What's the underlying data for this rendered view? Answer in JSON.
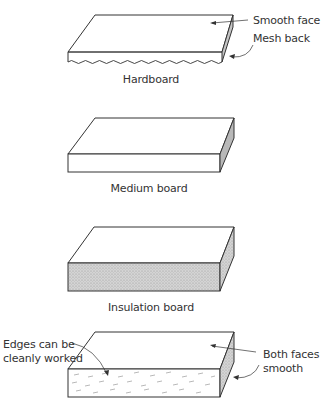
{
  "figure": {
    "boards": [
      {
        "name": "Hardboard",
        "callouts": [
          "Smooth face",
          "Mesh back"
        ]
      },
      {
        "name": "Medium board",
        "callouts": []
      },
      {
        "name": "Insulation board",
        "callouts": []
      },
      {
        "name": "",
        "callouts": [
          "Edges can be cleanly worked",
          "Both faces smooth"
        ],
        "callout_lines": {
          "left": [
            "Edges can be",
            "cleanly worked"
          ],
          "right": [
            "Both faces",
            "smooth"
          ]
        }
      }
    ]
  },
  "colors": {
    "line": "#333333",
    "face_fill": "#ffffff",
    "side_shade": "#bdbdbd",
    "insulation_front": "#c8c8c8"
  }
}
